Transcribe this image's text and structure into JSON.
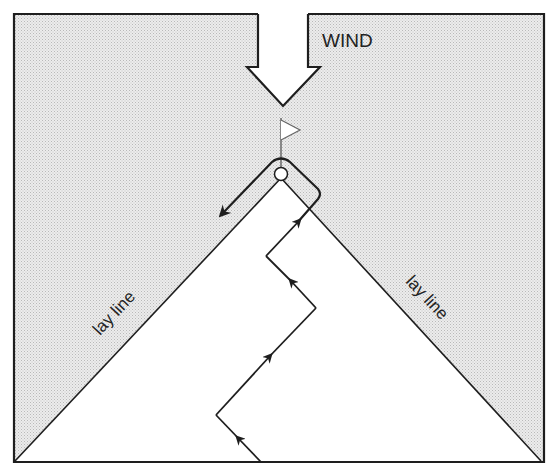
{
  "diagram": {
    "type": "sailing-upwind-course",
    "wind_label": "WIND",
    "left_layline_label": "lay line",
    "right_layline_label": "lay line",
    "colors": {
      "background": "#ffffff",
      "shaded_area": "#e4e4e4",
      "stroke": "#1e1e1e"
    },
    "elements": {
      "wind_arrow": "wind-direction-arrow",
      "mark": "windward-mark-buoy",
      "flag": "mark-flag",
      "course_path": "tacking-course-path",
      "laylines": [
        "left-layline",
        "right-layline"
      ]
    }
  }
}
